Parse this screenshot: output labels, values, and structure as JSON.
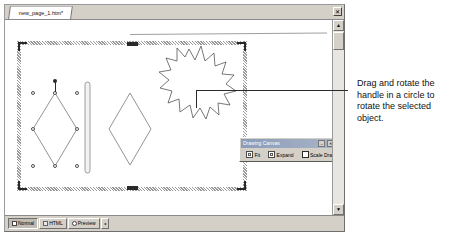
{
  "window": {
    "document_tab_label": "new_page_1.htm*",
    "close_button": "✕"
  },
  "canvas_toolbar": {
    "title": "Drawing Canvas",
    "minimize_label": "–",
    "close_label": "✕",
    "buttons": [
      {
        "label": "Fit",
        "icon": "fit-icon"
      },
      {
        "label": "Expand",
        "icon": "expand-icon"
      },
      {
        "label": "Scale Drawing",
        "icon": "scale-drawing-icon"
      }
    ]
  },
  "view_tabs": [
    {
      "label": "Normal",
      "icon": "normal-view-icon",
      "active": true
    },
    {
      "label": "HTML",
      "icon": "html-view-icon",
      "active": false
    },
    {
      "label": "Preview",
      "icon": "preview-view-icon",
      "active": false
    }
  ],
  "view_bar": {
    "spinner_label": "◂"
  },
  "scrollbar": {
    "up_arrow": "▲",
    "down_arrow": "▼"
  },
  "annotation": {
    "text": "Drag and rotate the handle in a circle to rotate the selected object."
  },
  "shapes": {
    "star": "explosion-star-shape",
    "selected_diamond": "selected-diamond-shape",
    "second_diamond": "diamond-shape",
    "vertical_bar": "rounded-bar-shape"
  }
}
